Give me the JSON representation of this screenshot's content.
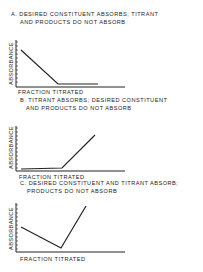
{
  "chart_data": [
    {
      "type": "line",
      "title": "A. DESIRED CONSTITUENT ABSORBS; TITRANT AND PRODUCTS DO NOT ABSORB",
      "title_lines": [
        "A. DESIRED CONSTITUENT  ABSORBS; TITRANT",
        "AND PRODUCTS DO NOT  ABSORB"
      ],
      "xlabel": "FRACTION  TITRATED",
      "ylabel": "ABSORBANCE",
      "grid": false,
      "series": [
        {
          "name": "absorbance",
          "x": [
            0,
            0.37,
            0.75
          ],
          "y": [
            0.78,
            0.07,
            0.07
          ]
        }
      ],
      "axis_box": {
        "x0": 16,
        "y_top": 40,
        "y_axis": 87,
        "x_end": 125
      },
      "points": [
        [
          21,
          50
        ],
        [
          58,
          84
        ],
        [
          98,
          84
        ]
      ]
    },
    {
      "type": "line",
      "title": "B. TITRANT ABSORBS; DESIRED CONSTITUENT AND PRODUCTS DO NOT ABSORB",
      "title_lines": [
        "B. TITRANT  ABSORBS; DESIRED  CONSTITUENT",
        "AND PRODUCTS  DO NOT  ABSORB"
      ],
      "xlabel": "FRACTION  TITRATED",
      "ylabel": "ABSORBANCE",
      "grid": false,
      "series": [
        {
          "name": "absorbance",
          "x": [
            0,
            0.42,
            0.73
          ],
          "y": [
            0.05,
            0.07,
            0.8
          ]
        }
      ],
      "axis_box": {
        "x0": 16,
        "y_top": 126,
        "y_axis": 171,
        "x_end": 125
      },
      "points": [
        [
          21,
          169
        ],
        [
          62,
          168
        ],
        [
          95,
          135
        ]
      ]
    },
    {
      "type": "line",
      "title": "C. DESIRED CONSTITUENT AND TITRANT ABSORB; PRODUCTS DO NOT ABSORB",
      "title_lines": [
        "C. DESIRED CONSTITUENT  AND  TITRANT  ABSORB;",
        "PRODUCTS  DO  NOT  ABSORB"
      ],
      "xlabel": "FRACTION  TITRATED",
      "ylabel": "ABSORBANCE",
      "grid": false,
      "series": [
        {
          "name": "absorbance",
          "x": [
            0,
            0.4,
            0.65
          ],
          "y": [
            0.5,
            0.08,
            0.93
          ]
        }
      ],
      "axis_box": {
        "x0": 16,
        "y_top": 203,
        "y_axis": 252,
        "x_end": 125
      },
      "points": [
        [
          21,
          227
        ],
        [
          61,
          248
        ],
        [
          86,
          206
        ]
      ]
    }
  ]
}
